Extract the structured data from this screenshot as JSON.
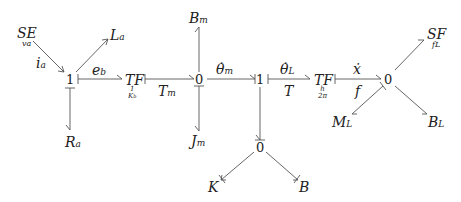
{
  "diagram": {
    "type": "bond graph",
    "nodes": {
      "se": {
        "label": "SE",
        "param": "v_a",
        "param_text": "va"
      },
      "la": {
        "label": "L",
        "sub": "a"
      },
      "ra": {
        "label": "R",
        "sub": "a"
      },
      "one_a": {
        "label": "1"
      },
      "tf1": {
        "label": "TF",
        "param_text": "1/K_b"
      },
      "zero_m": {
        "label": "0"
      },
      "bm": {
        "label": "B",
        "sub": "m"
      },
      "jm": {
        "label": "J",
        "sub": "m"
      },
      "one_b": {
        "label": "1"
      },
      "zero_k": {
        "label": "0"
      },
      "k": {
        "label": "K"
      },
      "b": {
        "label": "B"
      },
      "tf2": {
        "label": "TF",
        "param_text": "h/2π"
      },
      "zero_l": {
        "label": "0"
      },
      "sf": {
        "label": "SF",
        "param": "f_L",
        "param_text": "fL"
      },
      "ml": {
        "label": "M",
        "sub": "L"
      },
      "bl": {
        "label": "B",
        "sub": "L"
      }
    },
    "bond_labels": {
      "ia": {
        "text": "i",
        "sub": "a"
      },
      "eb": {
        "text": "e",
        "sub": "b"
      },
      "tm": {
        "text": "T",
        "sub": "m"
      },
      "theta_m": {
        "text": "θ̇",
        "sub": "m"
      },
      "theta_l": {
        "text": "θ̇",
        "sub": "L"
      },
      "t": {
        "text": "T"
      },
      "xdot": {
        "text": "ẋ"
      },
      "f": {
        "text": "f"
      }
    },
    "tf1_num": "1",
    "tf1_den": "K",
    "tf1_den_sub": "b",
    "tf2_num": "h",
    "tf2_den": "2π"
  }
}
